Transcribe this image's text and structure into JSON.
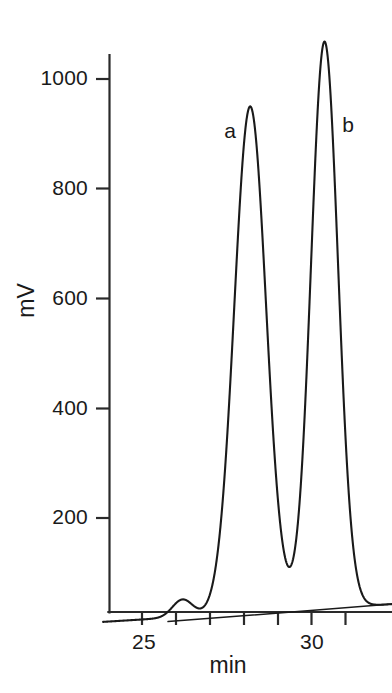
{
  "figure": {
    "background_color": "#ffffff",
    "line_color": "#1a1a1a"
  },
  "chart_data": {
    "type": "line",
    "title": "",
    "subtitle": "",
    "xlabel": "min",
    "ylabel": "mV",
    "xlim": [
      23.8,
      32.4
    ],
    "ylim": [
      0,
      1120
    ],
    "grid": false,
    "legend": null,
    "x_ticks": [
      25,
      26,
      27,
      28,
      29,
      30,
      31
    ],
    "x_tick_labels": [
      "25",
      "",
      "",
      "",
      "",
      "30",
      ""
    ],
    "y_ticks": [
      200,
      400,
      600,
      800,
      1000
    ],
    "y_tick_labels": [
      "200",
      "400",
      "600",
      "800",
      "1000"
    ],
    "annotations": [
      {
        "label": "a",
        "x": 27.6,
        "y": 880,
        "peak_x": 28.2,
        "peak_y": 950
      },
      {
        "label": "b",
        "x": 31.0,
        "y": 890,
        "peak_x": 30.4,
        "peak_y": 1065
      }
    ],
    "series": [
      {
        "name": "chromatogram-trace",
        "type": "line",
        "color": "#1a1a1a",
        "peaks": [
          {
            "id": "impurity",
            "center": 26.2,
            "height": 32,
            "width": 0.3
          },
          {
            "id": "a",
            "center": 28.2,
            "height": 925,
            "width": 0.47
          },
          {
            "id": "b",
            "center": 30.4,
            "height": 1035,
            "width": 0.4
          }
        ],
        "baseline": {
          "start_x": 24.5,
          "start_y": 10,
          "end_x": 32.4,
          "end_y": 40
        }
      },
      {
        "name": "baseline-drift-line",
        "type": "line",
        "color": "#1a1a1a",
        "points": [
          [
            25.77,
            8
          ],
          [
            32.4,
            40
          ]
        ]
      }
    ],
    "x_values": [
      25.0,
      25.5,
      26.0,
      26.2,
      26.5,
      27.0,
      27.5,
      28.0,
      28.2,
      28.5,
      29.0,
      29.3,
      29.5,
      30.0,
      30.4,
      30.8,
      31.5,
      32.0
    ],
    "y_values": [
      6,
      8,
      22,
      40,
      20,
      12,
      120,
      860,
      950,
      790,
      130,
      78,
      120,
      690,
      1065,
      520,
      45,
      42
    ]
  }
}
